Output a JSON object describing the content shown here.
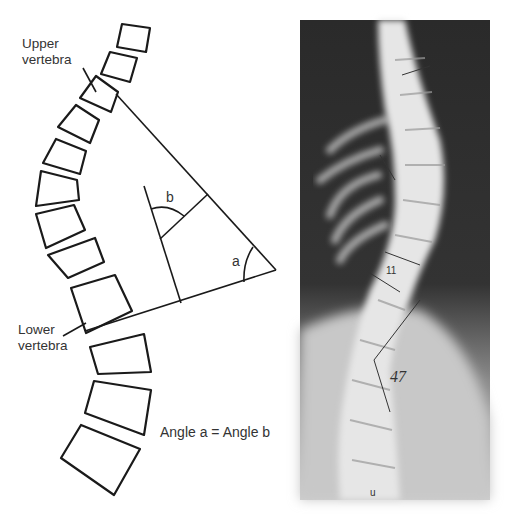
{
  "figure": {
    "diagram": {
      "labels": {
        "upper_vertebra": [
          "Upper",
          "vertebra"
        ],
        "lower_vertebra": [
          "Lower",
          "vertebra"
        ],
        "angle_a": "a",
        "angle_b": "b",
        "equation": "Angle a = Angle b"
      },
      "line_color": "#1a1a1a",
      "vertebra_count": 13
    },
    "xray": {
      "annotations": {
        "vertebra_mark": "11",
        "cobb_angle": "47",
        "bottom_mark": "u"
      },
      "background_color": "#2e2e2e",
      "bone_color": "#e6e6e6"
    }
  }
}
